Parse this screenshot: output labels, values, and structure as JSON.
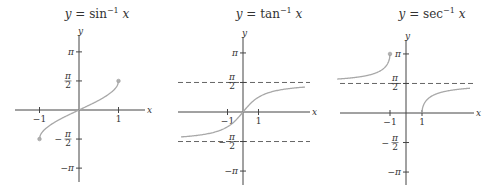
{
  "chart_data": [
    {
      "type": "line",
      "title": "y = sin⁻¹ x",
      "title_parts": {
        "lhs": "y",
        "eq": " = ",
        "fn": "sin",
        "sup": "−1",
        "arg": "x"
      },
      "xlabel": "x",
      "ylabel": "y",
      "xlim": [
        -1.6,
        1.65
      ],
      "ylim": [
        -3.14159,
        3.14159
      ],
      "x_ticks": [
        {
          "value": -1,
          "label": "−1"
        },
        {
          "value": 1,
          "label": "1"
        }
      ],
      "y_ticks": [
        {
          "value": 3.14159,
          "label": "π"
        },
        {
          "value": 1.5708,
          "label": "π/2"
        },
        {
          "value": -1.5708,
          "label": "−π/2"
        },
        {
          "value": -3.14159,
          "label": "−π"
        }
      ],
      "asymptotes": [],
      "series": [
        {
          "name": "arcsin",
          "domain": [
            -1,
            1
          ],
          "function": "asin",
          "endpoints": [
            [
              -1,
              -1.5708
            ],
            [
              1,
              1.5708
            ]
          ]
        }
      ],
      "grid": false
    },
    {
      "type": "line",
      "title": "y = tan⁻¹ x",
      "title_parts": {
        "lhs": "y",
        "eq": " = ",
        "fn": "tan",
        "sup": "−1",
        "arg": "x"
      },
      "xlabel": "x",
      "ylabel": "y",
      "xlim": [
        -4,
        4.2
      ],
      "ylim": [
        -3.14159,
        3.14159
      ],
      "x_ticks": [
        {
          "value": -1,
          "label": "−1"
        },
        {
          "value": 1,
          "label": "1"
        }
      ],
      "y_ticks": [
        {
          "value": 3.14159,
          "label": "π"
        },
        {
          "value": 1.5708,
          "label": "π/2"
        },
        {
          "value": -1.5708,
          "label": "−π/2"
        },
        {
          "value": -3.14159,
          "label": "−π"
        }
      ],
      "asymptotes": [
        {
          "y": 1.5708
        },
        {
          "y": -1.5708
        }
      ],
      "series": [
        {
          "name": "arctan",
          "domain": [
            -4,
            4
          ],
          "function": "atan",
          "endpoints": []
        }
      ],
      "grid": false
    },
    {
      "type": "line",
      "title": "y = sec⁻¹ x",
      "title_parts": {
        "lhs": "y",
        "eq": " = ",
        "fn": "sec",
        "sup": "−1",
        "arg": "x"
      },
      "xlabel": "x",
      "ylabel": "y",
      "xlim": [
        -4.3,
        4.2
      ],
      "ylim": [
        -3.14159,
        3.14159
      ],
      "x_ticks": [
        {
          "value": -1,
          "label": "−1"
        },
        {
          "value": 1,
          "label": "1"
        }
      ],
      "y_ticks": [
        {
          "value": 3.14159,
          "label": "π"
        },
        {
          "value": 1.5708,
          "label": "π/2"
        },
        {
          "value": -1.5708,
          "label": "−π/2"
        },
        {
          "value": -3.14159,
          "label": "−π"
        }
      ],
      "asymptotes": [
        {
          "y": 1.5708
        }
      ],
      "series": [
        {
          "name": "arcsec-left",
          "domain": [
            -4.3,
            -1
          ],
          "function": "asec",
          "endpoints": [
            [
              -1,
              3.14159
            ]
          ]
        },
        {
          "name": "arcsec-right",
          "domain": [
            1,
            4
          ],
          "function": "asec",
          "endpoints": []
        }
      ],
      "grid": false
    }
  ],
  "panels_layout": [
    {
      "origin": [
        79,
        110
      ],
      "sx": 39.5,
      "sy": 18.5,
      "x_axis": [
        15,
        145
      ],
      "y_axis": [
        35,
        182
      ],
      "title_pos": [
        97,
        18
      ]
    },
    {
      "origin": [
        243,
        112
      ],
      "sx": 15.5,
      "sy": 18.8,
      "x_axis": [
        178,
        310
      ],
      "y_axis": [
        37,
        185
      ],
      "title_pos": [
        269,
        18
      ]
    },
    {
      "origin": [
        406,
        113
      ],
      "sx": 16,
      "sy": 18.8,
      "x_axis": [
        340,
        474
      ],
      "y_axis": [
        40,
        185
      ],
      "title_pos": [
        432,
        18
      ]
    }
  ],
  "colors": {
    "axis": "#444444",
    "curve": "#a8a8a8",
    "asymptote": "#555555",
    "text": "#333333"
  }
}
